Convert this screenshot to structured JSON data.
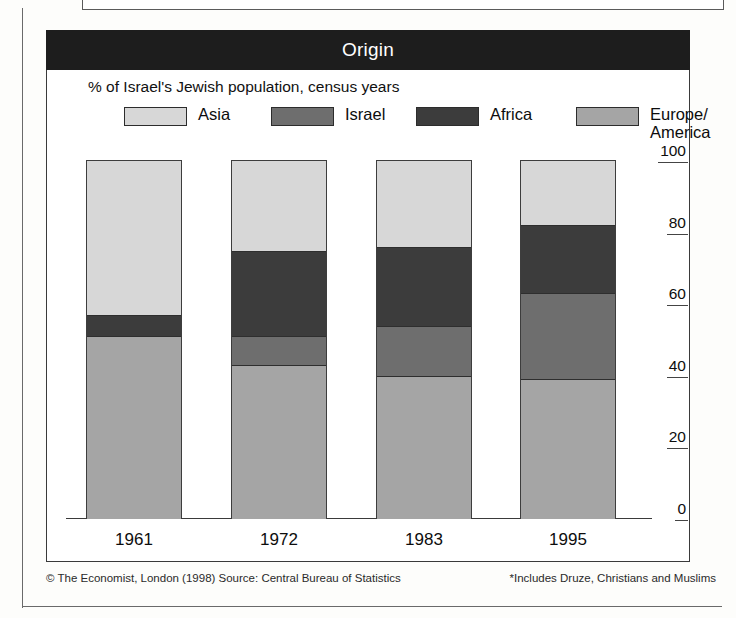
{
  "header": {
    "title": "Origin"
  },
  "subtitle": "% of Israel's Jewish population, census years",
  "footer": {
    "credit": "© The Economist, London (1998) Source: Central Bureau of Statistics",
    "note": "*Includes Druze, Christians and Muslims"
  },
  "colors": {
    "asia": "#d7d7d7",
    "israel": "#6e6e6e",
    "africa": "#3c3c3c",
    "europe_america": "#a5a5a5",
    "title_band": "#1d1d1d",
    "frame": "#3a3a3a",
    "text": "#0d0d0d"
  },
  "chart_data": {
    "type": "bar",
    "subtype": "stacked-100",
    "title": "Origin",
    "subtitle": "% of Israel's Jewish population, census years",
    "xlabel": "",
    "ylabel": "",
    "ylim": [
      0,
      100
    ],
    "yticks": [
      0,
      20,
      40,
      60,
      80,
      100
    ],
    "grid": false,
    "legend_position": "top",
    "axis_position": "right",
    "categories": [
      "1961",
      "1972",
      "1983",
      "1995"
    ],
    "series": [
      {
        "name": "Europe/America",
        "color": "#a5a5a5",
        "values": [
          51,
          43,
          40,
          39
        ]
      },
      {
        "name": "Israel",
        "color": "#6e6e6e",
        "values": [
          0,
          8,
          14,
          24
        ]
      },
      {
        "name": "Africa",
        "color": "#3c3c3c",
        "values": [
          6,
          24,
          22,
          19
        ]
      },
      {
        "name": "Asia",
        "color": "#d7d7d7",
        "values": [
          43,
          25,
          24,
          18
        ]
      }
    ],
    "legend": [
      {
        "label": "Asia",
        "color": "#d7d7d7"
      },
      {
        "label": "Israel",
        "color": "#6e6e6e"
      },
      {
        "label": "Africa",
        "color": "#3c3c3c"
      },
      {
        "label": "Europe/\nAmerica",
        "color": "#a5a5a5"
      }
    ]
  }
}
